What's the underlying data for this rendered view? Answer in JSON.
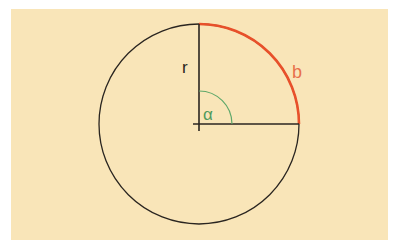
{
  "diagram": {
    "title": "",
    "background_color": "#f9e5b8",
    "circle": {
      "cx": 199,
      "cy": 124,
      "r": 100,
      "stroke": "#2a2520"
    },
    "radius_label": "r",
    "arc_label": "b",
    "angle_label": "α",
    "colors": {
      "line": "#2a2520",
      "arc": "#e8502a",
      "angle": "#5fa86a",
      "arc_label": "#e8704a",
      "angle_label": "#4f9a5c",
      "radius_label": "#2a2520"
    },
    "angle_degrees": 90
  }
}
